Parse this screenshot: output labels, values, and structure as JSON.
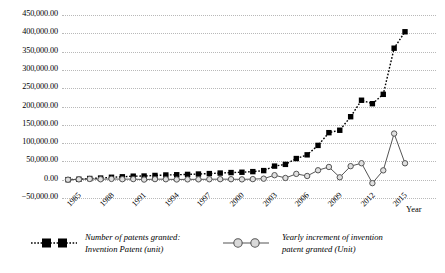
{
  "chart_data": {
    "type": "line",
    "title": "",
    "xlabel": "Year",
    "ylabel": "",
    "grid": true,
    "legend_position": "bottom",
    "ylim": [
      -50000,
      450000
    ],
    "yticks": [
      "450,000.00",
      "400,000.00",
      "350,000.00",
      "300,000.00",
      "250,000.00",
      "200,000.00",
      "150,000.00",
      "100,000.00",
      "50,000.00",
      "0.00",
      "−50,000.00"
    ],
    "ytick_values": [
      450000,
      400000,
      350000,
      300000,
      250000,
      200000,
      150000,
      100000,
      50000,
      0,
      -50000
    ],
    "xticks": [
      "1985",
      "1988",
      "1991",
      "1994",
      "1997",
      "2000",
      "2003",
      "2006",
      "2009",
      "2012",
      "2015"
    ],
    "xtick_values": [
      1985,
      1988,
      1991,
      1994,
      1997,
      2000,
      2003,
      2006,
      2009,
      2012,
      2015
    ],
    "x": [
      1985,
      1986,
      1987,
      1988,
      1989,
      1990,
      1991,
      1992,
      1993,
      1994,
      1995,
      1996,
      1997,
      1998,
      1999,
      2000,
      2001,
      2002,
      2003,
      2004,
      2005,
      2006,
      2007,
      2008,
      2009,
      2010,
      2011,
      2012,
      2013,
      2014,
      2015,
      2016
    ],
    "series": [
      {
        "name": "Number of patents granted: Invention Patent (unit)",
        "marker": "filled-square",
        "line_style": "dotted",
        "color": "#000000",
        "values": [
          138,
          1159,
          3257,
          4443,
          6607,
          7963,
          9640,
          10022,
          11609,
          12881,
          13527,
          14494,
          15484,
          16707,
          18149,
          19478,
          20423,
          22058,
          24858,
          37142,
          41873,
          57786,
          67940,
          93706,
          128489,
          135110,
          172113,
          217105,
          207688,
          233228,
          359316,
          404208
        ]
      },
      {
        "name": "Yearly increment of invention patent granted (Unit)",
        "marker": "open-circle",
        "line_style": "solid",
        "color": "#808080",
        "values": [
          0,
          1021,
          2098,
          1186,
          2164,
          1356,
          1677,
          382,
          1587,
          1272,
          646,
          967,
          990,
          1223,
          1442,
          1329,
          945,
          1635,
          2800,
          12284,
          4731,
          15913,
          10154,
          25766,
          34783,
          6621,
          37003,
          44992,
          -9417,
          25540,
          126088,
          44892
        ]
      }
    ],
    "annotations": []
  },
  "legend": {
    "entries": [
      {
        "key": "squares-key",
        "line1": "Number of patents granted:",
        "line2": "Invention Patent (unit)"
      },
      {
        "key": "circles-key",
        "line1": "Yearly increment of invention",
        "line2": "patent granted (Unit)"
      }
    ]
  },
  "colors": {
    "grid": "#b9b9b9",
    "square_series": "#000000",
    "circle_series": "#808080",
    "background": "#ffffff"
  }
}
